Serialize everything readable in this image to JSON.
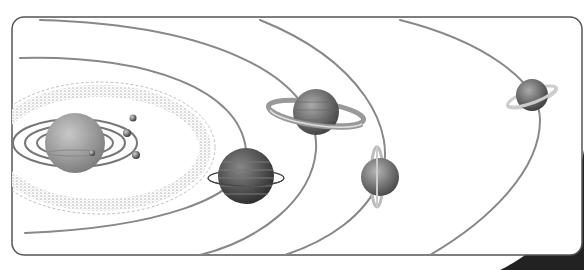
{
  "diagram": {
    "style": "grayscale",
    "frame": {
      "x": 12,
      "y": 17,
      "w": 570,
      "h": 238,
      "radius": 12,
      "stroke": "#555555"
    },
    "sun": {
      "label": "Sun",
      "cx": 75,
      "cy": 143,
      "r": 30
    },
    "inner_planets": [
      {
        "label": "Mercury",
        "cx": 92,
        "cy": 153,
        "r": 3
      },
      {
        "label": "Venus",
        "cx": 127,
        "cy": 133,
        "r": 4
      },
      {
        "label": "Earth",
        "cx": 133,
        "cy": 118,
        "r": 3.5
      },
      {
        "label": "Mars",
        "cx": 136,
        "cy": 155,
        "r": 4
      }
    ],
    "asteroid_belt": {
      "label": "Asteroid belt"
    },
    "outer_planets": [
      {
        "label": "Jupiter",
        "cx": 246,
        "cy": 176,
        "r": 28
      },
      {
        "label": "Saturn",
        "cx": 316,
        "cy": 112,
        "r": 23
      },
      {
        "label": "Uranus",
        "cx": 380,
        "cy": 177,
        "r": 19
      },
      {
        "label": "Neptune",
        "cx": 532,
        "cy": 95,
        "r": 16
      }
    ]
  }
}
